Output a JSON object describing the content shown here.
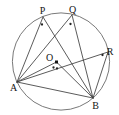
{
  "figure": {
    "name": "circle-inscribed-angles-diagram",
    "background": "#ffffff",
    "width": 119,
    "height": 115,
    "styles": {
      "chord_color": "#3d3d3d",
      "chord_width": 0.85,
      "circle_color": "#6a6a6a",
      "circle_width": 0.9,
      "label_color": "#141414",
      "label_font_size": 10,
      "dot_color": "#242424",
      "dot_radius": 1.15,
      "marker_color": "#141414"
    },
    "circle": {
      "cx": 61,
      "cy": 61.5,
      "r": 48.6
    },
    "points": [
      {
        "id": "P",
        "label": "P",
        "x": 43,
        "y": 17,
        "label_x": 42.5,
        "label_y": 14,
        "label_anchor": "middle"
      },
      {
        "id": "Q",
        "label": "Q",
        "x": 72,
        "y": 15,
        "label_x": 72.5,
        "label_y": 12.5,
        "label_anchor": "middle"
      },
      {
        "id": "R",
        "label": "R",
        "x": 108,
        "y": 52,
        "label_x": 110,
        "label_y": 55,
        "label_anchor": "middle"
      },
      {
        "id": "A",
        "label": "A",
        "x": 17,
        "y": 82,
        "label_x": 13.5,
        "label_y": 90.5,
        "label_anchor": "middle"
      },
      {
        "id": "B",
        "label": "B",
        "x": 93,
        "y": 98,
        "label_x": 95.5,
        "label_y": 108.5,
        "label_anchor": "middle"
      },
      {
        "id": "O",
        "label": "O",
        "x": 56.5,
        "y": 62,
        "label_x": 49.5,
        "label_y": 61,
        "label_anchor": "middle"
      }
    ],
    "segments": [
      {
        "from": "A",
        "to": "P"
      },
      {
        "from": "A",
        "to": "Q"
      },
      {
        "from": "A",
        "to": "O"
      },
      {
        "from": "A",
        "to": "R"
      },
      {
        "from": "A",
        "to": "B"
      },
      {
        "from": "B",
        "to": "P"
      },
      {
        "from": "B",
        "to": "Q"
      },
      {
        "from": "B",
        "to": "O"
      },
      {
        "from": "B",
        "to": "R"
      }
    ],
    "angle_dots": [
      {
        "at": "P",
        "x": 42,
        "y": 24.5
      },
      {
        "at": "Q",
        "x": 70.5,
        "y": 24
      },
      {
        "at": "R",
        "x": 102.5,
        "y": 55
      },
      {
        "at": "O",
        "x": 53.5,
        "y": 67.5
      },
      {
        "at": "O",
        "x": 57,
        "y": 68.5
      }
    ],
    "center_marker": {
      "x": 56.5,
      "y": 62,
      "size": 3
    }
  }
}
